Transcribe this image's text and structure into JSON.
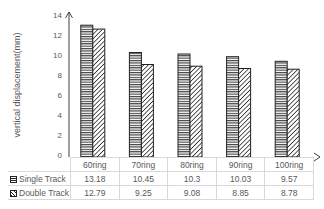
{
  "chart_data": {
    "type": "bar",
    "title": "",
    "xlabel": "",
    "ylabel": "vertical displacement(mm)",
    "ylim": [
      0,
      14
    ],
    "yticks": [
      0,
      2,
      4,
      6,
      8,
      10,
      12,
      14
    ],
    "grid": false,
    "legend_position": "data-table",
    "categories": [
      "60ring",
      "70ring",
      "80ring",
      "90ring",
      "100ring"
    ],
    "series": [
      {
        "name": "Single Track",
        "pattern": "horizontal-lines",
        "values": [
          13.18,
          10.45,
          10.3,
          10.03,
          9.57
        ]
      },
      {
        "name": "Double Track",
        "pattern": "diagonal-lines",
        "values": [
          12.79,
          9.25,
          9.08,
          8.85,
          8.78
        ]
      }
    ],
    "data_table": true
  },
  "table": {
    "single_label": "Single Track",
    "double_label": "Double Track"
  },
  "colors": {
    "bar_stroke": "#222222",
    "text": "#595959",
    "table_border": "#d9d9d9"
  }
}
